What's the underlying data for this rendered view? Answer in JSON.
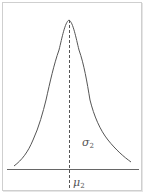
{
  "diagram": {
    "type": "bell-curve",
    "curve_label": "σ",
    "curve_label_sub": "2",
    "mean_label": "μ",
    "mean_label_sub": "2",
    "colors": {
      "curve": "#555555",
      "axis": "#666666",
      "dashed_mean_line": "#555555",
      "frame": "#cfcfcf"
    }
  }
}
